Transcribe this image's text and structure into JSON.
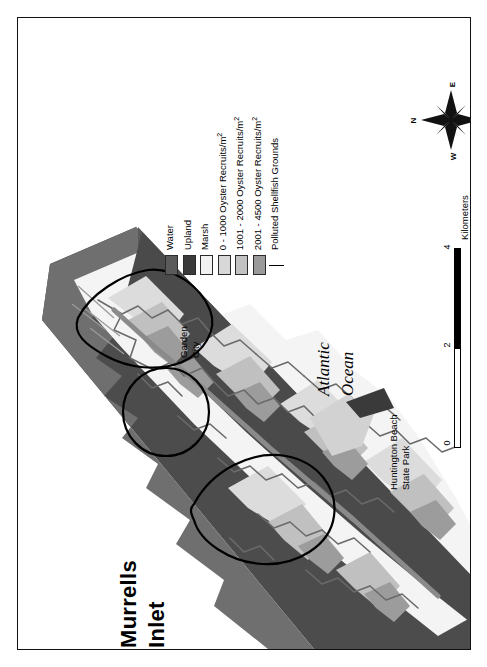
{
  "map": {
    "title_line1": "Murrells",
    "title_line2": "Inlet",
    "ocean_label_line1": "Atlantic",
    "ocean_label_line2": "Ocean",
    "places": [
      {
        "name": "garden-city",
        "line1": "Garden",
        "line2": "City"
      },
      {
        "name": "huntington-beach-state-park",
        "line1": "Huntington Beach",
        "line2": "State Park"
      }
    ],
    "data_source": "Data Source: Baruch GIP Lab."
  },
  "legend": {
    "items": [
      {
        "label": "Water",
        "symbol": "swatch",
        "color": "#5a5a5a"
      },
      {
        "label": "Upland",
        "symbol": "swatch",
        "color": "#3a3a3a"
      },
      {
        "label": "Marsh",
        "symbol": "swatch",
        "color": "#f2f2f2"
      },
      {
        "label": "0 - 1000 Oyster Recruits/m",
        "sup": "2",
        "symbol": "swatch",
        "color": "#d8d8d8"
      },
      {
        "label": "1001 - 2000 Oyster Recruits/m",
        "sup": "2",
        "symbol": "swatch",
        "color": "#c2c2c2"
      },
      {
        "label": "2001 - 4500 Oyster Recruits/m",
        "sup": "2",
        "symbol": "swatch",
        "color": "#9a9a9a"
      },
      {
        "label": "Polluted Shellfish Grounds",
        "symbol": "line",
        "color": "#000000"
      }
    ]
  },
  "compass": {
    "north": "N",
    "east": "E",
    "south": "S",
    "west": "W"
  },
  "scalebar": {
    "ticks": [
      "0",
      "2",
      "4"
    ],
    "units": "Kilometers"
  },
  "colors": {
    "water": "#4c4c4c",
    "upland": "#6f6f6f",
    "marsh": "#f4f4f4",
    "recruit_low": "#dcdcdc",
    "recruit_mid": "#c0c0c0",
    "recruit_high": "#9c9c9c",
    "outline": "#000000",
    "paper": "#ffffff"
  }
}
